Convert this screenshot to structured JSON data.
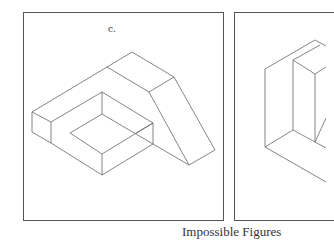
{
  "figures": {
    "panel_c": {
      "label": "c."
    },
    "panel_d": {
      "label": ""
    }
  },
  "caption": "Impossible Figures",
  "colors": {
    "frame": "#555555",
    "line": "#666666",
    "text": "#333333",
    "background": "#ffffff"
  }
}
